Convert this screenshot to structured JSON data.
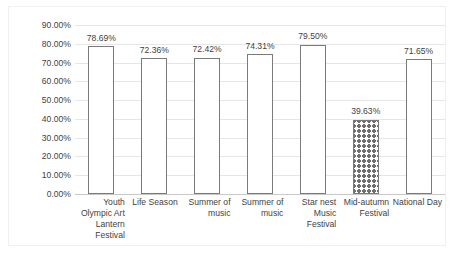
{
  "chart_data": {
    "type": "bar",
    "title": "",
    "subtitle": "",
    "xlabel": "",
    "ylabel": "",
    "ylim": [
      0,
      90
    ],
    "grid": true,
    "legend": "none",
    "y_tick_labels": [
      "90.00%",
      "80.00%",
      "70.00%",
      "60.00%",
      "50.00%",
      "40.00%",
      "30.00%",
      "20.00%",
      "10.00%",
      "0.00%"
    ],
    "y_tick_values": [
      90,
      80,
      70,
      60,
      50,
      40,
      30,
      20,
      10,
      0
    ],
    "categories": [
      "Youth Olympic Art Lantern Festival",
      "Life Season",
      "Summer of music",
      "Summer of music",
      "Star nest Music Festival",
      "Mid-autumn Festival",
      "National Day"
    ],
    "values": [
      78.69,
      72.36,
      72.42,
      74.31,
      79.5,
      39.63,
      71.65
    ],
    "value_labels": [
      "78.69%",
      "72.36%",
      "72.42%",
      "74.31%",
      "79.50%",
      "39.63%",
      "71.65%"
    ],
    "bar_patterns": [
      "dotted",
      "dotted",
      "dotted",
      "dotted",
      "dotted",
      "zigzag",
      "dotted"
    ],
    "colors": {
      "bar_outline": "#7a7a7a",
      "bar_fill": "#ffffff",
      "pattern": "#8a8a8a",
      "gridline": "#e6e6e6",
      "axis": "#c8c8c8",
      "text": "#3f3f3f",
      "frame": "#f0f0f0",
      "background": "#ffffff"
    }
  }
}
